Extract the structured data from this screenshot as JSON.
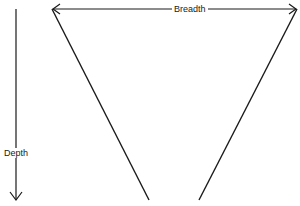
{
  "diagram": {
    "type": "funnel-v",
    "labels": {
      "breadth": "Breadth",
      "depth": "Depth"
    },
    "colors": {
      "stroke": "#1a1a1a",
      "background": "#ffffff"
    },
    "geometry": {
      "v_left_top": [
        52,
        9
      ],
      "v_right_top": [
        297,
        9
      ],
      "v_left_bottom": [
        149,
        200
      ],
      "v_right_bottom": [
        199,
        200
      ],
      "depth_arrow_x": 16,
      "depth_arrow_y": [
        9,
        200
      ]
    }
  }
}
